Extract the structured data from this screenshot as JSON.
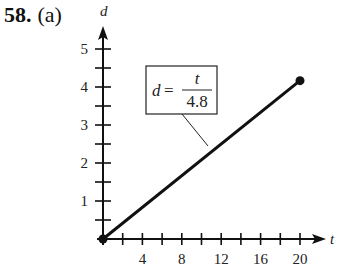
{
  "problem": {
    "number": "58.",
    "part": "(a)"
  },
  "chart_data": {
    "type": "line",
    "title": "",
    "xlabel": "t",
    "ylabel": "d",
    "x": [
      0,
      20
    ],
    "series": [
      {
        "name": "d = t/4.8",
        "values": [
          0,
          4.1667
        ]
      }
    ],
    "xlim": [
      0,
      21
    ],
    "ylim": [
      0,
      5.5
    ],
    "x_ticks": [
      4,
      8,
      12,
      16,
      20
    ],
    "x_minor_ticks_every": 2,
    "y_ticks": [
      1,
      2,
      3,
      4,
      5
    ],
    "y_minor_ticks_every": 0.5,
    "grid": false,
    "endpoints": "filled dots at (0,0) and (20, 4.17)",
    "annotation": {
      "text": "d = t / 4.8",
      "numerator": "t",
      "denominator": "4.8",
      "lhs": "d"
    }
  }
}
